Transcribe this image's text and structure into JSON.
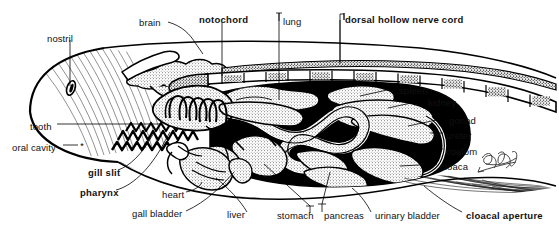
{
  "figure": {
    "kind": "anatomical-diagram",
    "signature": "artist signature",
    "colors": {
      "ink": "#000000",
      "paper": "#ffffff",
      "coelom_fill": "#000000",
      "organ_fill": "#f2f2f2"
    }
  },
  "labels": [
    {
      "id": "nostril",
      "text": "nostril",
      "bold": false,
      "x": 47,
      "y": 34,
      "align": "left"
    },
    {
      "id": "brain",
      "text": "brain",
      "bold": false,
      "x": 139,
      "y": 18,
      "align": "left"
    },
    {
      "id": "notochord",
      "text": "notochord",
      "bold": true,
      "x": 199,
      "y": 15,
      "align": "left"
    },
    {
      "id": "lung",
      "text": "lung",
      "bold": false,
      "x": 283,
      "y": 17,
      "align": "left"
    },
    {
      "id": "dorsal-hollow-nerve-cord",
      "text": "dorsal hollow nerve cord",
      "bold": true,
      "x": 345,
      "y": 15,
      "align": "left"
    },
    {
      "id": "spleen",
      "text": "spleen",
      "bold": false,
      "x": 399,
      "y": 86,
      "align": "left"
    },
    {
      "id": "kidney",
      "text": "kidney",
      "bold": false,
      "x": 428,
      "y": 98,
      "align": "left"
    },
    {
      "id": "gonad",
      "text": "gonad",
      "bold": false,
      "x": 449,
      "y": 116,
      "align": "left"
    },
    {
      "id": "ureter",
      "text": "ureter",
      "bold": false,
      "x": 446,
      "y": 131,
      "align": "left"
    },
    {
      "id": "coelom",
      "text": "coelom",
      "bold": false,
      "x": 446,
      "y": 147,
      "align": "left"
    },
    {
      "id": "cloaca",
      "text": "cloaca",
      "bold": false,
      "x": 440,
      "y": 162,
      "align": "left"
    },
    {
      "id": "tooth",
      "text": "tooth",
      "bold": false,
      "x": 30,
      "y": 122,
      "align": "left"
    },
    {
      "id": "oral-cavity",
      "text": "oral cavity",
      "bold": false,
      "x": 12,
      "y": 143,
      "align": "left"
    },
    {
      "id": "gill-slit",
      "text": "gill slit",
      "bold": true,
      "x": 88,
      "y": 168,
      "align": "left"
    },
    {
      "id": "pharynx",
      "text": "pharynx",
      "bold": true,
      "x": 80,
      "y": 188,
      "align": "left"
    },
    {
      "id": "heart",
      "text": "heart",
      "bold": false,
      "x": 162,
      "y": 190,
      "align": "left"
    },
    {
      "id": "gall-bladder",
      "text": "gall bladder",
      "bold": false,
      "x": 132,
      "y": 209,
      "align": "left"
    },
    {
      "id": "liver",
      "text": "liver",
      "bold": false,
      "x": 227,
      "y": 210,
      "align": "left"
    },
    {
      "id": "stomach",
      "text": "stomach",
      "bold": false,
      "x": 277,
      "y": 211,
      "align": "left"
    },
    {
      "id": "pancreas",
      "text": "pancreas",
      "bold": false,
      "x": 324,
      "y": 211,
      "align": "left"
    },
    {
      "id": "urinary-bladder",
      "text": "urinary bladder",
      "bold": false,
      "x": 375,
      "y": 211,
      "align": "left"
    },
    {
      "id": "cloacal-aperture",
      "text": "cloacal aperture",
      "bold": true,
      "x": 466,
      "y": 211,
      "align": "left"
    }
  ],
  "structures": [
    {
      "id": "body-outline",
      "name": "body outline"
    },
    {
      "id": "nostril-opening",
      "name": "nostril opening"
    },
    {
      "id": "tooth-row",
      "name": "tooth row"
    },
    {
      "id": "oral-cavity-marker",
      "name": "oral cavity asterisk"
    },
    {
      "id": "brain-mass",
      "name": "brain"
    },
    {
      "id": "nerve-cord-band",
      "name": "dorsal hollow nerve cord"
    },
    {
      "id": "notochord-band",
      "name": "segmented notochord"
    },
    {
      "id": "pharynx-chamber",
      "name": "pharynx"
    },
    {
      "id": "gill-arches",
      "name": "gill slits"
    },
    {
      "id": "coelom-cavity",
      "name": "coelom"
    },
    {
      "id": "lung-mass",
      "name": "lung"
    },
    {
      "id": "heart-mass",
      "name": "heart"
    },
    {
      "id": "liver-mass",
      "name": "liver"
    },
    {
      "id": "gall-bladder-mass",
      "name": "gall bladder"
    },
    {
      "id": "stomach-mass",
      "name": "stomach"
    },
    {
      "id": "intestine-coil",
      "name": "intestine"
    },
    {
      "id": "pancreas-mass",
      "name": "pancreas"
    },
    {
      "id": "spleen-mass",
      "name": "spleen"
    },
    {
      "id": "kidney-mass",
      "name": "kidney"
    },
    {
      "id": "gonad-mass",
      "name": "gonad"
    },
    {
      "id": "ureter-duct",
      "name": "ureter"
    },
    {
      "id": "cloaca-chamber",
      "name": "cloaca"
    },
    {
      "id": "urinary-bladder-mass",
      "name": "urinary bladder"
    },
    {
      "id": "tail-shading",
      "name": "tail shading"
    }
  ]
}
